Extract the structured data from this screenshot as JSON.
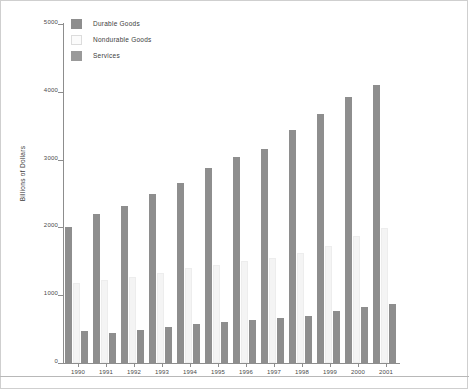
{
  "chart_data": {
    "type": "bar",
    "title": "",
    "xlabel": "",
    "ylabel": "Billions of Dollars",
    "ylim": [
      0,
      5000
    ],
    "yticks": [
      0,
      1000,
      2000,
      3000,
      4000,
      5000
    ],
    "grid": false,
    "legend_position": "top-left",
    "categories": [
      "1990",
      "1991",
      "1992",
      "1993",
      "1994",
      "1995",
      "1996",
      "1997",
      "1998",
      "1999",
      "2000",
      "2001"
    ],
    "series": [
      {
        "name": "Durable Goods",
        "color": "#8e8e8e",
        "values": [
          467,
          443,
          488,
          538,
          580,
          608,
          635,
          670,
          694,
          760,
          820,
          870
        ]
      },
      {
        "name": "Nondurable Goods",
        "color": "#f4f4f4",
        "values": [
          1175,
          1225,
          1270,
          1330,
          1400,
          1450,
          1500,
          1550,
          1620,
          1720,
          1880,
          1990
        ]
      },
      {
        "name": "Services",
        "color": "#8e8e8e",
        "values": [
          2010,
          2200,
          2310,
          2490,
          2650,
          2880,
          3040,
          3160,
          3440,
          3670,
          3920,
          4100
        ]
      }
    ]
  },
  "legend": {
    "items": [
      {
        "label": "Durable Goods",
        "swatch": "sw-durable"
      },
      {
        "label": "Nondurable Goods",
        "swatch": "sw-nondur"
      },
      {
        "label": "Services",
        "swatch": "sw-services"
      }
    ]
  },
  "axis": {
    "y_label": "Billions of Dollars"
  }
}
